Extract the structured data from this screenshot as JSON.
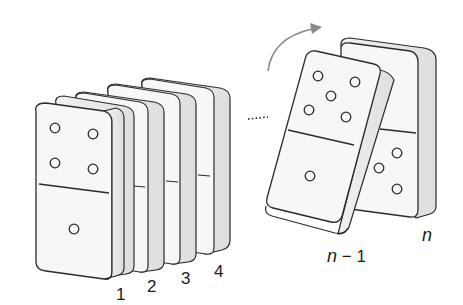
{
  "diagram": {
    "labels": {
      "d1": "1",
      "d2": "2",
      "d3": "3",
      "d4": "4",
      "d_n_minus_1_var": "n",
      "d_n_minus_1_rest": " − 1",
      "d_n": "n"
    },
    "front_domino": {
      "top_pips": 4,
      "bottom_pips": 1
    },
    "tipping_domino": {
      "top_pips": 5,
      "bottom_pips": 1
    },
    "last_domino_visible_bottom_pips": 3,
    "ellipsis": "......",
    "arrow": "curved-rotation-arrow",
    "colors": {
      "outline": "#2b2b2b",
      "face": "#f7f7f7",
      "side": "#e6e6e6",
      "arrow": "#8a8a8a"
    }
  }
}
